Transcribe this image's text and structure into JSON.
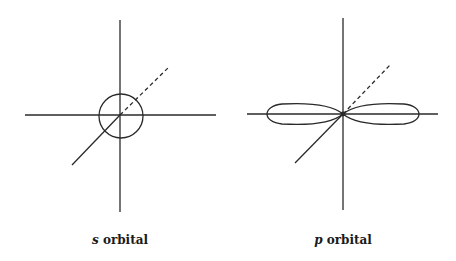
{
  "figure": {
    "panels": [
      {
        "id": "s",
        "orbital_symbol": "s",
        "label_suffix": " orbital",
        "shape": "sphere (circle)"
      },
      {
        "id": "p",
        "orbital_symbol": "p",
        "label_suffix": " orbital",
        "shape": "dumbbell (two lobes along horizontal axis)"
      }
    ],
    "colors": {
      "stroke": "#2a2a2a",
      "background": "#ffffff",
      "text": "#1a1a1a"
    }
  }
}
